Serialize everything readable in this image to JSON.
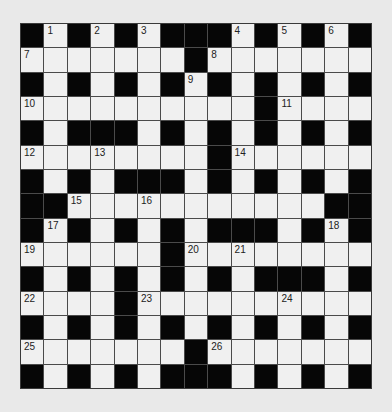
{
  "puzzle": {
    "rows": 15,
    "cols": 15,
    "colors": {
      "background": "#e9e9e9",
      "white_cell": "#f0f0f0",
      "black_cell": "#060606",
      "grid_line": "#4a4a4a"
    },
    "grid": [
      [
        "#",
        "1",
        "#",
        "2",
        "#",
        "3",
        "#",
        "#",
        "#",
        "4",
        "#",
        "5",
        "#",
        "6",
        "#"
      ],
      [
        "7",
        ".",
        ".",
        ".",
        ".",
        ".",
        ".",
        "#",
        "8",
        ".",
        ".",
        ".",
        ".",
        ".",
        "."
      ],
      [
        "#",
        ".",
        "#",
        ".",
        "#",
        ".",
        "#",
        "9",
        "#",
        ".",
        "#",
        ".",
        "#",
        ".",
        "#"
      ],
      [
        "10",
        ".",
        ".",
        ".",
        ".",
        ".",
        ".",
        ".",
        ".",
        ".",
        "#",
        "11",
        ".",
        ".",
        "."
      ],
      [
        "#",
        ".",
        "#",
        "#",
        "#",
        ".",
        "#",
        ".",
        "#",
        ".",
        "#",
        ".",
        "#",
        ".",
        "#"
      ],
      [
        "12",
        ".",
        ".",
        "13",
        ".",
        ".",
        ".",
        ".",
        "#",
        "14",
        ".",
        ".",
        ".",
        ".",
        "."
      ],
      [
        "#",
        ".",
        "#",
        ".",
        "#",
        "#",
        "#",
        ".",
        "#",
        ".",
        "#",
        ".",
        "#",
        ".",
        "#"
      ],
      [
        "#",
        "#",
        "15",
        ".",
        ".",
        "16",
        ".",
        ".",
        ".",
        ".",
        ".",
        ".",
        ".",
        "#",
        "#"
      ],
      [
        "#",
        "17",
        "#",
        ".",
        "#",
        ".",
        "#",
        ".",
        "#",
        "#",
        "#",
        ".",
        "#",
        "18",
        "#"
      ],
      [
        "19",
        ".",
        ".",
        ".",
        ".",
        ".",
        "#",
        "20",
        ".",
        "21",
        ".",
        ".",
        ".",
        ".",
        "."
      ],
      [
        "#",
        ".",
        "#",
        ".",
        "#",
        ".",
        "#",
        ".",
        "#",
        ".",
        "#",
        "#",
        "#",
        ".",
        "#"
      ],
      [
        "22",
        ".",
        ".",
        ".",
        "#",
        "23",
        ".",
        ".",
        ".",
        ".",
        ".",
        "24",
        ".",
        ".",
        "."
      ],
      [
        "#",
        ".",
        "#",
        ".",
        "#",
        ".",
        "#",
        ".",
        "#",
        ".",
        "#",
        ".",
        "#",
        ".",
        "#"
      ],
      [
        "25",
        ".",
        ".",
        ".",
        ".",
        ".",
        ".",
        "#",
        "26",
        ".",
        ".",
        ".",
        ".",
        ".",
        "."
      ],
      [
        "#",
        ".",
        "#",
        ".",
        "#",
        ".",
        "#",
        "#",
        "#",
        ".",
        "#",
        ".",
        "#",
        ".",
        "#"
      ]
    ],
    "clue_numbers": [
      "1",
      "2",
      "3",
      "4",
      "5",
      "6",
      "7",
      "8",
      "9",
      "10",
      "11",
      "12",
      "13",
      "14",
      "15",
      "16",
      "17",
      "18",
      "19",
      "20",
      "21",
      "22",
      "23",
      "24",
      "25",
      "26"
    ]
  }
}
